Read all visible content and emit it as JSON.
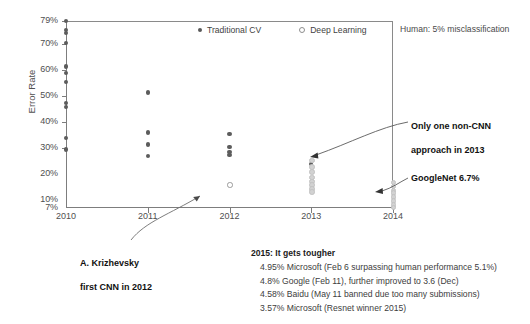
{
  "chart_data": {
    "type": "scatter",
    "title": "",
    "xlabel": "",
    "ylabel": "Error Rate",
    "x_categories": [
      "2010",
      "2011",
      "2012",
      "2013",
      "2014"
    ],
    "y_ticks": [
      "79%",
      "70%",
      "60%",
      "50%",
      "40%",
      "30%",
      "20%",
      "10%",
      "7%"
    ],
    "y_tick_values": [
      79,
      70,
      60,
      50,
      40,
      30,
      20,
      10,
      7
    ],
    "ylim": [
      7,
      79
    ],
    "grid": false,
    "legend_position": "top-center",
    "legend": [
      {
        "label": "Traditional CV",
        "marker": "filled-dot",
        "color": "#595959"
      },
      {
        "label": "Deep Learning",
        "marker": "hollow-dot",
        "color": "#8e8e8e"
      }
    ],
    "series": [
      {
        "name": "Traditional CV",
        "points": [
          {
            "year": 2010,
            "error": 79.0
          },
          {
            "year": 2010,
            "error": 75.5
          },
          {
            "year": 2010,
            "error": 74.5
          },
          {
            "year": 2010,
            "error": 70.5
          },
          {
            "year": 2010,
            "error": 61.5
          },
          {
            "year": 2010,
            "error": 59.0
          },
          {
            "year": 2010,
            "error": 55.5
          },
          {
            "year": 2010,
            "error": 47.5
          },
          {
            "year": 2010,
            "error": 46.0
          },
          {
            "year": 2010,
            "error": 34.0
          },
          {
            "year": 2010,
            "error": 29.5
          },
          {
            "year": 2011,
            "error": 51.5
          },
          {
            "year": 2011,
            "error": 36.0
          },
          {
            "year": 2011,
            "error": 31.5
          },
          {
            "year": 2011,
            "error": 27.0
          },
          {
            "year": 2012,
            "error": 35.5
          },
          {
            "year": 2012,
            "error": 30.5
          },
          {
            "year": 2012,
            "error": 28.5
          },
          {
            "year": 2012,
            "error": 27.5
          },
          {
            "year": 2013,
            "error": 24.0
          }
        ]
      },
      {
        "name": "Deep Learning",
        "points": [
          {
            "year": 2012,
            "error": 16.0
          },
          {
            "year": 2013,
            "error": 25.5
          },
          {
            "year": 2013,
            "error": 23.0
          },
          {
            "year": 2013,
            "error": 21.0
          },
          {
            "year": 2013,
            "error": 19.0
          },
          {
            "year": 2013,
            "error": 17.5
          },
          {
            "year": 2013,
            "error": 16.0
          },
          {
            "year": 2013,
            "error": 14.5
          },
          {
            "year": 2013,
            "error": 13.5
          },
          {
            "year": 2014,
            "error": 17.0
          },
          {
            "year": 2014,
            "error": 15.5
          },
          {
            "year": 2014,
            "error": 14.0
          },
          {
            "year": 2014,
            "error": 13.0
          },
          {
            "year": 2014,
            "error": 11.5
          },
          {
            "year": 2014,
            "error": 10.0
          },
          {
            "year": 2014,
            "error": 8.5
          },
          {
            "year": 2014,
            "error": 7.5
          }
        ]
      }
    ],
    "annotations": [
      {
        "id": "human-line",
        "text": "Human: 5% misclassification"
      },
      {
        "id": "non-cnn",
        "text": "Only one non-CNN\napproach in 2013"
      },
      {
        "id": "googlenet",
        "text": "GoogleNet 6.7%"
      },
      {
        "id": "krizhevsky",
        "text": "A. Krizhevsky\nfirst CNN in 2012"
      }
    ]
  },
  "axis": {
    "y_label": "Error Rate",
    "y_ticks": [
      "79%",
      "70%",
      "60%",
      "50%",
      "40%",
      "30%",
      "20%",
      "10%",
      "7%"
    ],
    "x_ticks": [
      "2010",
      "2011",
      "2012",
      "2013",
      "2014"
    ]
  },
  "legend": {
    "traditional_cv": "Traditional CV",
    "deep_learning": "Deep Learning"
  },
  "notes": {
    "human": "Human: 5% misclassification",
    "non_cnn_line1": "Only one non-CNN",
    "non_cnn_line2": "approach in 2013",
    "googlenet": "GoogleNet 6.7%",
    "krizhevsky_line1": "A. Krizhevsky",
    "krizhevsky_line2": "first CNN in 2012"
  },
  "facts": {
    "heading": "2015: It gets tougher",
    "items": [
      "4.95% Microsoft (Feb 6 surpassing human performance 5.1%)",
      "4.8% Google (Feb 11), further improved to 3.6 (Dec)",
      "4.58% Baidu (May 11 banned due too many submissions)",
      "3.57% Microsoft (Resnet winner 2015)"
    ]
  }
}
